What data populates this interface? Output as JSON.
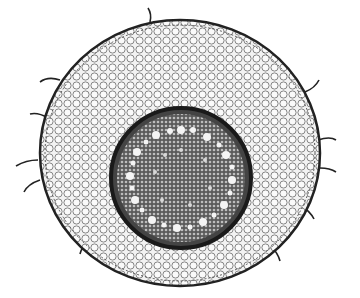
{
  "image": {
    "subject": "Root cross-section illustration",
    "colors": {
      "background": "#ffffff",
      "ink": "#1a1a1a",
      "cortex_fill": "#e8e8e8",
      "stele_fill": "#6a6a6a",
      "endodermis": "#222222",
      "vessel": "#f4f4f4"
    }
  }
}
